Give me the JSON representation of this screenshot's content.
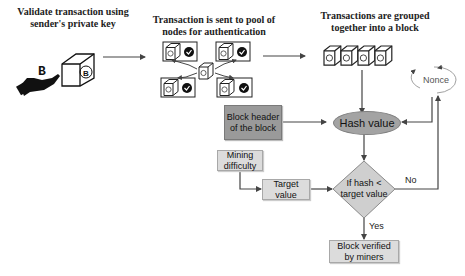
{
  "steps": {
    "validate": "Validate transaction using\nsender's private key",
    "validate_line1": "Validate transaction using",
    "validate_line2": "sender's private key",
    "pool_line1": "Transaction is sent to pool of",
    "pool_line2": "nodes for authentication",
    "grouped_line1": "Transactions are grouped",
    "grouped_line2": "together into a block"
  },
  "flow": {
    "block_header_line1": "Block header",
    "block_header_line2": "of the block",
    "hash_value": "Hash value",
    "nonce": "Nonce",
    "mining_difficulty_line1": "Mining",
    "mining_difficulty_line2": "difficulty",
    "target_value_line1": "Target",
    "target_value_line2": "value",
    "decision_line1": "If hash <",
    "decision_line2": "target value",
    "no_label": "No",
    "yes_label": "Yes",
    "verified_line1": "Block verified",
    "verified_line2": "by miners"
  },
  "icons": {
    "bitcoin_symbol": "B",
    "check": "✓"
  },
  "colors": {
    "dark_box": "#9a9a9a",
    "light_box": "#dcdcdc",
    "ellipse": "#a3a3a3",
    "diamond": "#cfcfcf",
    "arrow": "#444444"
  }
}
